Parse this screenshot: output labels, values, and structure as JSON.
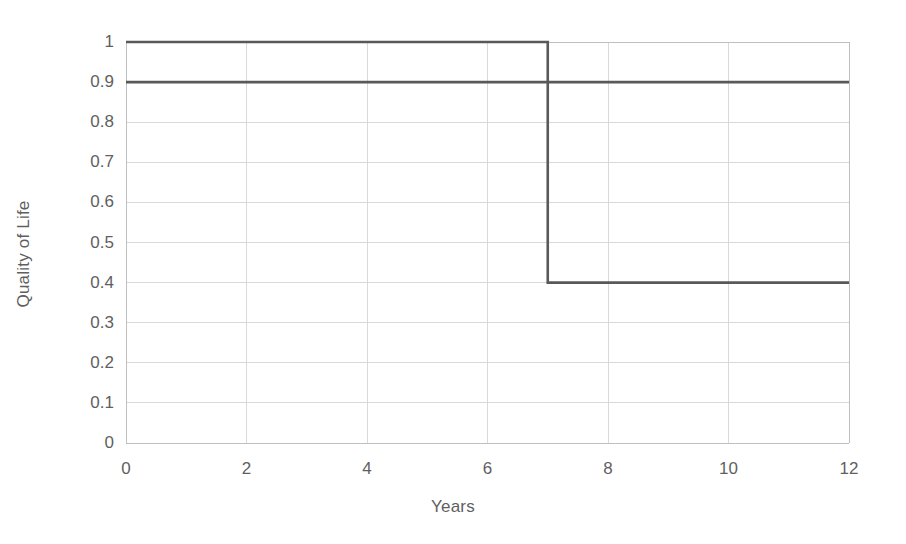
{
  "chart_data": {
    "type": "line",
    "title": "",
    "subtitle": "",
    "xlabel": "Years",
    "ylabel": "Quality of Life",
    "xlim": [
      0,
      12
    ],
    "ylim": [
      0,
      1
    ],
    "xticks": [
      "0",
      "2",
      "4",
      "6",
      "8",
      "10",
      "12"
    ],
    "xtick_values": [
      0,
      2,
      4,
      6,
      8,
      10,
      12
    ],
    "yticks": [
      "1",
      "0.9",
      "0.8",
      "0.7",
      "0.6",
      "0.5",
      "0.4",
      "0.3",
      "0.2",
      "0.1",
      "0"
    ],
    "ytick_values": [
      1,
      0.9,
      0.8,
      0.7,
      0.6,
      0.5,
      0.4,
      0.3,
      0.2,
      0.1,
      0
    ],
    "grid": true,
    "grid_x": true,
    "grid_y": true,
    "legend": "none",
    "annotations": [],
    "series": [
      {
        "name": "step-drop-series",
        "style": "step",
        "color": "#595959",
        "x": [
          0,
          7,
          7,
          12
        ],
        "values": [
          1.0,
          1.0,
          0.4,
          0.4
        ]
      },
      {
        "name": "flat-series",
        "style": "step",
        "color": "#595959",
        "x": [
          0,
          12
        ],
        "values": [
          0.9,
          0.9
        ]
      }
    ]
  },
  "colors": {
    "line": "#595959",
    "grid": "#d9d9d9",
    "axis": "#bfbfbf",
    "text": "#5f5f5f",
    "background": "#ffffff"
  }
}
